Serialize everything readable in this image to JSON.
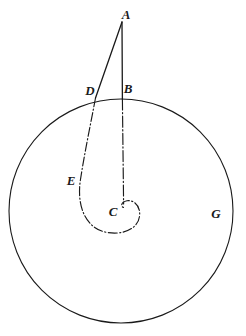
{
  "figure": {
    "type": "geometric-diagram",
    "background_color": "#ffffff",
    "stroke_color": "#1a1a1a",
    "labels": [
      {
        "id": "A",
        "text": "A",
        "x": 126,
        "y": 14
      },
      {
        "id": "B",
        "text": "B",
        "x": 128,
        "y": 88
      },
      {
        "id": "D",
        "text": "D",
        "x": 90,
        "y": 90
      },
      {
        "id": "E",
        "text": "E",
        "x": 71,
        "y": 180
      },
      {
        "id": "C",
        "text": "C",
        "x": 113,
        "y": 211
      },
      {
        "id": "G",
        "text": "G",
        "x": 216,
        "y": 213
      }
    ],
    "circle": {
      "name": "main-circle",
      "cx": 121,
      "cy": 211,
      "r": 112,
      "stroke_width": 1.1
    },
    "points": {
      "A": {
        "x": 122,
        "y": 22
      },
      "B": {
        "x": 122,
        "y": 99
      },
      "D": {
        "x": 96,
        "y": 97
      },
      "E": {
        "x": 80,
        "y": 180
      },
      "C": {
        "x": 124,
        "y": 205
      },
      "G": {
        "x": 232,
        "y": 213
      }
    },
    "segments": [
      {
        "name": "segment-A-B",
        "from": "A",
        "to": "B",
        "style": "solid",
        "stroke_width": 1.3
      },
      {
        "name": "segment-A-D",
        "from": "A",
        "to": "D",
        "style": "solid",
        "stroke_width": 1.3
      }
    ],
    "dashed_lines": [
      {
        "name": "line-B-C",
        "style": "dash-dot",
        "stroke_width": 1.1
      }
    ],
    "curves": [
      {
        "name": "spiral-D-E-C",
        "style": "dash-dot",
        "stroke_width": 1.1,
        "path": "M 96,97 C 90,124 84,152 80,180 C 76,206 84,227 104,232 C 122,236 137,229 139,217 C 141,207 134,200 127,201 C 122,202 120,206 124,208"
      }
    ]
  }
}
